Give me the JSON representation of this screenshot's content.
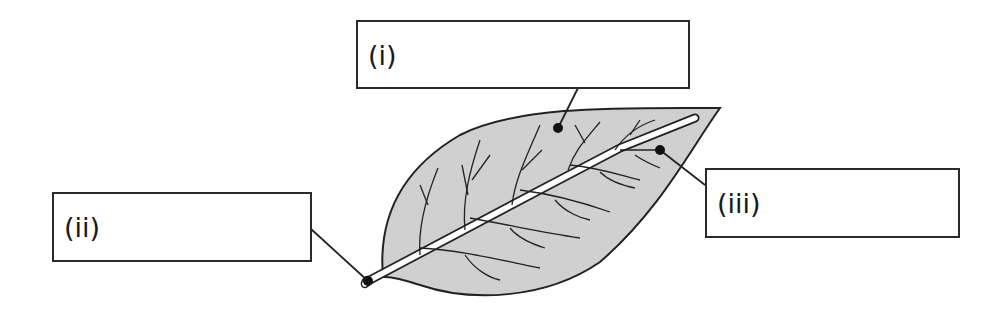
{
  "diagram": {
    "colors": {
      "leaf_fill": "#d0d0d0",
      "outline": "#222222",
      "vein": "#ffffff"
    },
    "labels": [
      {
        "id": "i",
        "text": "(i)",
        "points_to": "leaf blade"
      },
      {
        "id": "ii",
        "text": "(ii)",
        "points_to": "petiole"
      },
      {
        "id": "iii",
        "text": "(iii)",
        "points_to": "vein"
      }
    ]
  }
}
